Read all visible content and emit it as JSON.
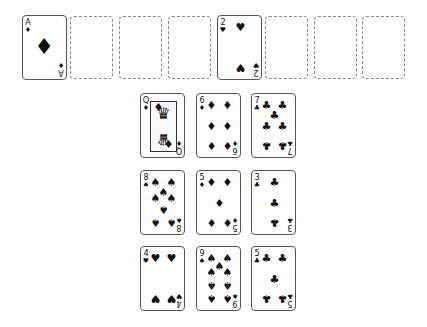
{
  "game": "Solitaire",
  "top_row": [
    {
      "type": "card",
      "rank": "A",
      "suit": "♦",
      "suit_name": "diamonds",
      "x": 22,
      "y": 15
    },
    {
      "type": "slot",
      "x": 70,
      "y": 16
    },
    {
      "type": "slot",
      "x": 119,
      "y": 16
    },
    {
      "type": "slot",
      "x": 168,
      "y": 16
    },
    {
      "type": "card",
      "rank": "2",
      "suit": "♥",
      "suit_name": "hearts",
      "x": 217,
      "y": 15
    },
    {
      "type": "slot",
      "x": 265,
      "y": 16
    },
    {
      "type": "slot",
      "x": 314,
      "y": 16
    },
    {
      "type": "slot",
      "x": 362,
      "y": 16
    }
  ],
  "tableau": [
    {
      "rank": "Q",
      "suit": "♦",
      "suit_name": "diamonds",
      "x": 140,
      "y": 93
    },
    {
      "rank": "6",
      "suit": "♦",
      "suit_name": "diamonds",
      "x": 196,
      "y": 93
    },
    {
      "rank": "7",
      "suit": "♣",
      "suit_name": "clubs",
      "x": 251,
      "y": 93
    },
    {
      "rank": "8",
      "suit": "♠",
      "suit_name": "spades",
      "x": 140,
      "y": 170
    },
    {
      "rank": "5",
      "suit": "♦",
      "suit_name": "diamonds",
      "x": 196,
      "y": 170
    },
    {
      "rank": "3",
      "suit": "♣",
      "suit_name": "clubs",
      "x": 251,
      "y": 170
    },
    {
      "rank": "4",
      "suit": "♥",
      "suit_name": "hearts",
      "x": 140,
      "y": 246
    },
    {
      "rank": "9",
      "suit": "♠",
      "suit_name": "spades",
      "x": 196,
      "y": 246
    },
    {
      "rank": "5",
      "suit": "♣",
      "suit_name": "clubs",
      "x": 251,
      "y": 246
    }
  ]
}
